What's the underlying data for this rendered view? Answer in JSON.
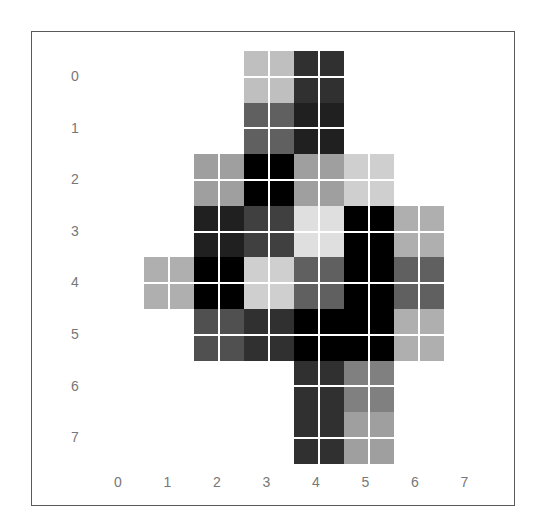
{
  "chart_data": {
    "type": "heatmap",
    "title": "",
    "xlabel": "",
    "ylabel": "",
    "colormap": "gray_r",
    "value_range": [
      0,
      16
    ],
    "x_ticks": [
      "0",
      "1",
      "2",
      "3",
      "4",
      "5",
      "6",
      "7"
    ],
    "y_ticks": [
      "0",
      "1",
      "2",
      "3",
      "4",
      "5",
      "6",
      "7"
    ],
    "grid": "white gridlines splitting each cell into 2x2",
    "matrix": [
      [
        0,
        0,
        0,
        4,
        13,
        0,
        0,
        0
      ],
      [
        0,
        0,
        0,
        10,
        14,
        0,
        0,
        0
      ],
      [
        0,
        0,
        6,
        16,
        6,
        3,
        0,
        0
      ],
      [
        0,
        0,
        14,
        12,
        2,
        16,
        5,
        0
      ],
      [
        0,
        5,
        16,
        3,
        10,
        16,
        10,
        0
      ],
      [
        0,
        0,
        11,
        13,
        16,
        16,
        5,
        0
      ],
      [
        0,
        0,
        0,
        0,
        13,
        8,
        0,
        0
      ],
      [
        0,
        0,
        0,
        0,
        13,
        6,
        0,
        0
      ]
    ]
  },
  "axes": {
    "x_labels": [
      "0",
      "1",
      "2",
      "3",
      "4",
      "5",
      "6",
      "7"
    ],
    "y_labels": [
      "0",
      "1",
      "2",
      "3",
      "4",
      "5",
      "6",
      "7"
    ]
  },
  "colors": {
    "border": "#5a5a5a",
    "tick_label": "#777777",
    "gridline": "#ffffff"
  }
}
